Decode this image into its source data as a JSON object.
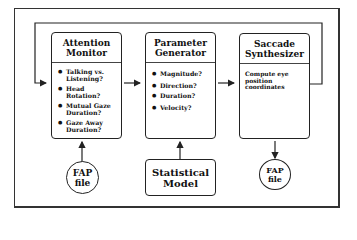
{
  "diagram": {
    "boxes": [
      {
        "title_line1": "Attention",
        "title_line2": "Monitor",
        "items": [
          "Talking vs. Listening?",
          "Head Rotation?",
          "Mutual Gaze Duration?",
          "Gaze Away Duration?"
        ]
      },
      {
        "title_line1": "Parameter",
        "title_line2": "Generator",
        "items": [
          "Magnitude?",
          "Direction?",
          "Duration?",
          "Velocity?"
        ]
      },
      {
        "title_line1": "Saccade",
        "title_line2": "Synthesizer",
        "body_text": "Compute eye position coordinates"
      }
    ],
    "inputs": [
      {
        "line1": "FAP",
        "line2": "file"
      },
      {
        "line1": "Statistical",
        "line2": "Model"
      }
    ],
    "outputs": [
      {
        "line1": "FAP",
        "line2": "file"
      }
    ],
    "colors": {
      "stroke": "#222222",
      "background": "#ffffff"
    }
  }
}
